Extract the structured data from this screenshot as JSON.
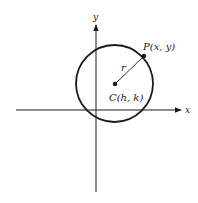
{
  "diagram": {
    "colors": {
      "stroke": "#1a1a1a",
      "background": "#ffffff"
    },
    "axes": {
      "x_label": "x",
      "y_label": "y"
    },
    "circle": {
      "center_label": "C(h, k)",
      "point_label": "P(x, y)",
      "radius_label": "r"
    }
  }
}
